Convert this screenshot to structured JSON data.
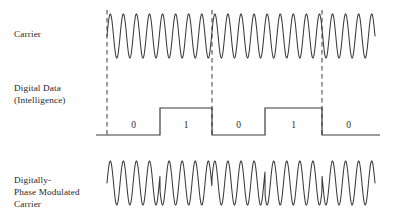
{
  "figure": {
    "background_color": "#ffffff",
    "trace_color": "#3a3a3a",
    "dashed_line_color": "#4a4a4a",
    "width": 406,
    "height": 223
  },
  "rows": {
    "carrier": {
      "label": "Carrier",
      "label_lines": [
        "Carrier"
      ]
    },
    "digital": {
      "label": "Digital Data\n(Intelligence)",
      "label_lines": [
        "Digital Data",
        "(Intelligence)"
      ]
    },
    "modulated": {
      "label": "Digitally-\nPhase Modulated\nCarrier",
      "label_lines": [
        "Digitally-",
        "Phase Modulated",
        "Carrier"
      ]
    }
  },
  "bit_labels": [
    "0",
    "1",
    "0",
    "1",
    "0"
  ],
  "chart_data": {
    "type": "line",
    "xlabel": "",
    "ylabel": "",
    "plot_x_start": 107,
    "plot_x_end": 375,
    "bit_boundaries": [
      107,
      160,
      212,
      265,
      322,
      375
    ],
    "dashed_marker_x": [
      107,
      212,
      322
    ],
    "bit_values": [
      0,
      1,
      0,
      1,
      0
    ],
    "bit_label_centers": [
      133.5,
      186,
      238.5,
      293.5,
      348.5
    ],
    "series": [
      {
        "name": "Carrier",
        "kind": "sine",
        "cycles": 20.5,
        "phase_inversions": [],
        "baseline_y": 36,
        "amplitude": 22,
        "x_start": 107,
        "x_end": 375
      },
      {
        "name": "Digital Data (Intelligence)",
        "kind": "square",
        "low_y": 135,
        "high_y": 108,
        "levels": [
          0,
          1,
          0,
          1,
          0
        ],
        "x_start": 107,
        "x_end": 375
      },
      {
        "name": "Digitally-Phase Modulated Carrier",
        "kind": "psk",
        "cycles": 20.5,
        "baseline_y": 183,
        "amplitude": 22,
        "x_start": 107,
        "x_end": 375,
        "phase_per_bit_degrees": [
          0,
          180,
          0,
          180,
          0
        ]
      }
    ],
    "grid": false,
    "legend": "none"
  }
}
